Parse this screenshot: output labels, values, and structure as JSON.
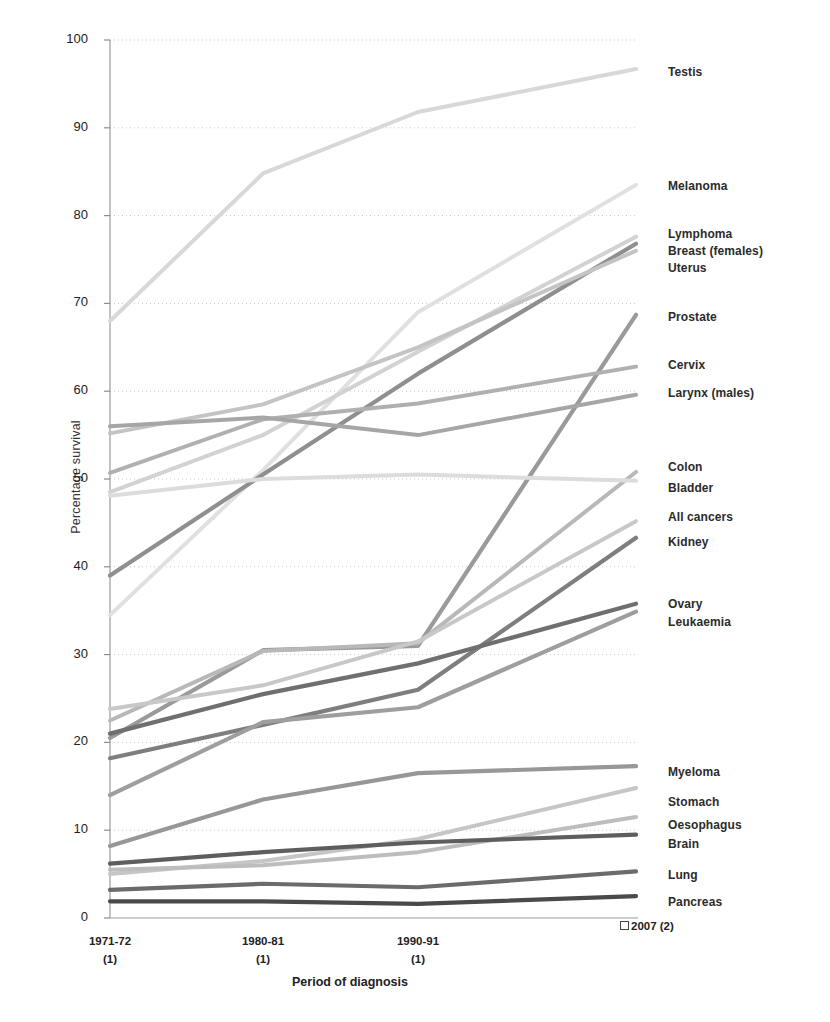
{
  "chart_data": {
    "type": "line",
    "title": "",
    "xlabel": "Period of diagnosis",
    "ylabel": "Percentage survival",
    "ylim": [
      0,
      100
    ],
    "ytick_values": [
      0,
      10,
      20,
      30,
      40,
      50,
      60,
      70,
      80,
      90,
      100
    ],
    "ytick_labels": [
      "0",
      "10",
      "20",
      "30",
      "40",
      "50",
      "60",
      "70",
      "80",
      "90",
      "100"
    ],
    "grid": "horizontal-dotted",
    "legend_position": "right-of-axis-line-end-labels",
    "categories": [
      "1971-72 (1)",
      "1980-81 (1)",
      "1990-91 (1)",
      "2007 (2)"
    ],
    "xtick_labels": [
      {
        "line1": "1971-72",
        "line2": "(1)"
      },
      {
        "line1": "1980-81",
        "line2": "(1)"
      },
      {
        "line1": "1990-91",
        "line2": "(1)"
      },
      {
        "line1": "2007 (2)",
        "line2": ""
      }
    ],
    "series": [
      {
        "name": "Testis",
        "values": [
          68.0,
          84.8,
          91.8,
          96.7
        ],
        "color": "#d8d8d8",
        "width": 4.0
      },
      {
        "name": "Melanoma",
        "values": [
          34.5,
          51.0,
          69.0,
          83.5
        ],
        "color": "#e0e0e0",
        "width": 4.0
      },
      {
        "name": "Lymphoma",
        "values": [
          48.5,
          55.0,
          64.5,
          77.6
        ],
        "color": "#d2d2d2",
        "width": 4.0
      },
      {
        "name": "Breast (females)",
        "values": [
          39.0,
          50.5,
          62.0,
          76.8
        ],
        "color": "#8f8f8f",
        "width": 4.2
      },
      {
        "name": "Uterus",
        "values": [
          55.2,
          58.5,
          65.0,
          76.0
        ],
        "color": "#c4c4c4",
        "width": 4.0
      },
      {
        "name": "Prostate",
        "values": [
          20.5,
          30.5,
          31.0,
          68.7
        ],
        "color": "#9a9a9a",
        "width": 4.2
      },
      {
        "name": "Cervix",
        "values": [
          50.7,
          56.8,
          58.6,
          62.8
        ],
        "color": "#b0b0b0",
        "width": 4.0
      },
      {
        "name": "Larynx (males)",
        "values": [
          56.0,
          57.0,
          55.0,
          59.6
        ],
        "color": "#a6a6a6",
        "width": 4.0
      },
      {
        "name": "Colon",
        "values": [
          22.5,
          30.4,
          31.3,
          50.8
        ],
        "color": "#b8b8b8",
        "width": 4.0
      },
      {
        "name": "Bladder",
        "values": [
          48.1,
          50.0,
          50.5,
          49.8
        ],
        "color": "#dcdcdc",
        "width": 4.0
      },
      {
        "name": "All cancers",
        "values": [
          23.8,
          26.5,
          31.5,
          45.2
        ],
        "color": "#c8c8c8",
        "width": 4.0
      },
      {
        "name": "Kidney",
        "values": [
          18.2,
          22.0,
          26.0,
          43.3
        ],
        "color": "#7e7e7e",
        "width": 4.2
      },
      {
        "name": "Ovary",
        "values": [
          21.0,
          25.5,
          29.0,
          35.8
        ],
        "color": "#6f6f6f",
        "width": 4.2
      },
      {
        "name": "Leukaemia",
        "values": [
          14.0,
          22.3,
          24.0,
          34.9
        ],
        "color": "#9e9e9e",
        "width": 4.2
      },
      {
        "name": "Myeloma",
        "values": [
          8.2,
          13.5,
          16.5,
          17.3
        ],
        "color": "#979797",
        "width": 4.2
      },
      {
        "name": "Stomach",
        "values": [
          5.0,
          6.5,
          9.0,
          14.8
        ],
        "color": "#c6c6c6",
        "width": 4.0
      },
      {
        "name": "Oesophagus",
        "values": [
          5.5,
          6.0,
          7.5,
          11.5
        ],
        "color": "#bdbdbd",
        "width": 4.0
      },
      {
        "name": "Brain",
        "values": [
          6.2,
          7.5,
          8.6,
          9.5
        ],
        "color": "#5e5e5e",
        "width": 4.2
      },
      {
        "name": "Lung",
        "values": [
          3.2,
          3.9,
          3.5,
          5.3
        ],
        "color": "#6b6b6b",
        "width": 4.2
      },
      {
        "name": "Pancreas",
        "values": [
          1.9,
          1.9,
          1.6,
          2.5
        ],
        "color": "#4a4a4a",
        "width": 4.2
      }
    ],
    "end_labels": [
      {
        "name": "Testis",
        "y_px": 73
      },
      {
        "name": "Melanoma",
        "y_px": 187
      },
      {
        "name": "Lymphoma",
        "y_px": 235
      },
      {
        "name": "Breast (females)",
        "y_px": 252
      },
      {
        "name": "Uterus",
        "y_px": 269
      },
      {
        "name": "Prostate",
        "y_px": 318
      },
      {
        "name": "Cervix",
        "y_px": 366
      },
      {
        "name": "Larynx (males)",
        "y_px": 394
      },
      {
        "name": "Colon",
        "y_px": 468
      },
      {
        "name": "Bladder",
        "y_px": 489
      },
      {
        "name": "All cancers",
        "y_px": 518
      },
      {
        "name": "Kidney",
        "y_px": 543
      },
      {
        "name": "Ovary",
        "y_px": 605
      },
      {
        "name": "Leukaemia",
        "y_px": 623
      },
      {
        "name": "Myeloma",
        "y_px": 773
      },
      {
        "name": "Stomach",
        "y_px": 803
      },
      {
        "name": "Oesophagus",
        "y_px": 826
      },
      {
        "name": "Brain",
        "y_px": 845
      },
      {
        "name": "Lung",
        "y_px": 876
      },
      {
        "name": "Pancreas",
        "y_px": 903
      }
    ]
  },
  "axis": {
    "y_title": "Percentage survival",
    "x_title": "Period of diagnosis"
  }
}
